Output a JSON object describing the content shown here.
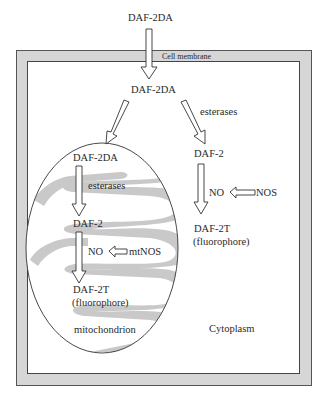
{
  "diagram": {
    "type": "cell-pathway-schematic",
    "top_label": "DAF-2DA",
    "membrane_label": "Cell membrane",
    "cytoplasm": {
      "entry_label": "DAF-2DA",
      "esterases_label": "esterases",
      "daf2_label": "DAF-2",
      "no_label": "NO",
      "nos_label": "NOS",
      "daf2t_label": "DAF-2T",
      "fluorophore_label": "(fluorophore)",
      "region_label": "Cytoplasm"
    },
    "mitochondrion": {
      "entry_label": "DAF-2DA",
      "esterases_label": "esterases",
      "daf2_label": "DAF-2",
      "no_label": "NO",
      "nos_label": "mtNOS",
      "daf2t_label": "DAF-2T",
      "fluorophore_label": "(fluorophore)",
      "region_label": "mitochondrion"
    },
    "colors": {
      "membrane_fill": "#d6d6d6",
      "membrane_stroke": "#555555",
      "cristae_fill": "#c9c9c9",
      "arrow_stroke": "#333333",
      "text": "#2a2a2a"
    }
  }
}
